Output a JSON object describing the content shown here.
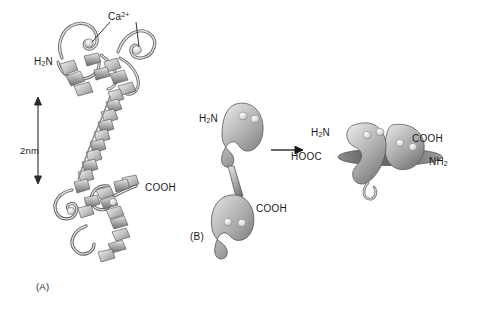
{
  "figure": {
    "type": "protein-structure-diagram",
    "background_color": "#ffffff",
    "ink_color": "#1a1a1a",
    "ribbon_light": "#e8e8e8",
    "ribbon_mid": "#b5b5b5",
    "ribbon_dark": "#6e6e6e",
    "blob_light": "#dcdcdc",
    "blob_dark": "#7a7a7a"
  },
  "panel_a": {
    "label": "(A)",
    "calcium_label_text": "Ca",
    "calcium_label_charge": "2+",
    "n_terminus": "H",
    "n_terminus_sub": "2",
    "n_terminus_tail": "N",
    "c_terminus": "COOH",
    "scale_bar": {
      "value": "2nm",
      "orientation": "vertical",
      "arrowheads": "both"
    },
    "calcium_site_count": 4
  },
  "panel_b": {
    "label": "(B)",
    "arrow": "right-arrow",
    "left_structure": {
      "name": "extended-dumbbell",
      "n_terminus": "H",
      "n_terminus_sub": "2",
      "n_terminus_tail": "N",
      "c_terminus": "COOH",
      "lobes": 2,
      "calcium_sites_per_lobe": 2
    },
    "right_structure": {
      "name": "collapsed-complex",
      "label_top_left": "H",
      "label_top_left_sub": "2",
      "label_top_left_tail": "N",
      "label_left": "HOOC",
      "label_top_right": "COOH",
      "label_right": "NH",
      "label_right_sub": "2"
    }
  }
}
